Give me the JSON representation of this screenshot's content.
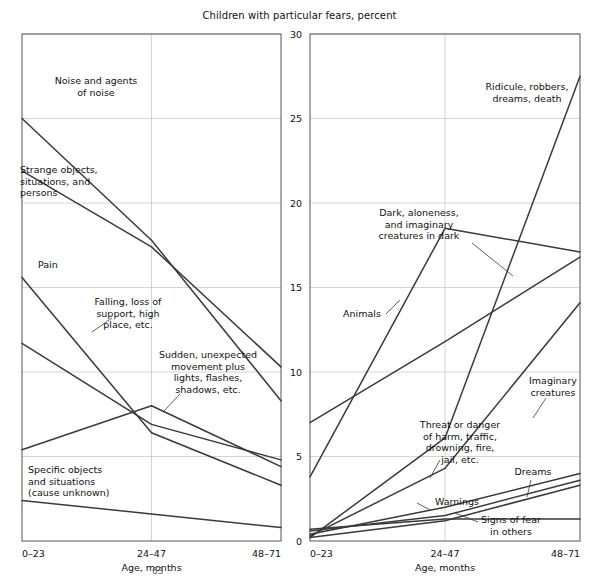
{
  "figure": {
    "title": "Children with particular fears, percent",
    "page_number": "63"
  },
  "chart_data": {
    "type": "line",
    "title": "Children with particular fears, percent",
    "xlabel": "Age, months",
    "ylabel": "",
    "categories": [
      "0–23",
      "24–47",
      "48–71"
    ],
    "ylim": [
      0,
      30
    ],
    "yticks": [
      0,
      5,
      10,
      15,
      20,
      25,
      30
    ],
    "grid": true,
    "legend": "annotations-on-lines",
    "panels": [
      {
        "name": "left-panel",
        "xlabel": "Age, months",
        "xticklabels": [
          "0–23",
          "24–47",
          "48–71"
        ],
        "series": [
          {
            "name": "Noise and agents of noise",
            "values": [
              25.0,
              17.8,
              8.3
            ]
          },
          {
            "name": "Strange objects, situations, and persons",
            "values": [
              21.9,
              17.4,
              10.3
            ]
          },
          {
            "name": "Pain",
            "values": [
              15.6,
              6.4,
              3.3
            ]
          },
          {
            "name": "Falling, loss of support, high place, etc.",
            "values": [
              11.7,
              6.9,
              4.8
            ]
          },
          {
            "name": "Sudden, unexpected movement plus lights, flashes, shadows, etc.",
            "values": [
              5.4,
              8.0,
              4.4
            ]
          },
          {
            "name": "Specific objects and situations (cause unknown)",
            "values": [
              2.4,
              1.6,
              0.8
            ]
          }
        ]
      },
      {
        "name": "right-panel",
        "xlabel": "Age, months",
        "xticklabels": [
          "0–23",
          "24–47",
          "48–71"
        ],
        "series": [
          {
            "name": "Ridicule, robbers, dreams, death",
            "values": [
              0.2,
              6.1,
              27.5
            ]
          },
          {
            "name": "Dark, aloneness, and imaginary creatures in dark",
            "values": [
              3.8,
              18.5,
              17.1
            ]
          },
          {
            "name": "Animals",
            "values": [
              7.0,
              11.8,
              16.8
            ]
          },
          {
            "name": "Imaginary creatures",
            "values": [
              0.3,
              4.3,
              14.1
            ]
          },
          {
            "name": "Threat or danger of harm, traffic, drowning, fire, jail, etc.",
            "values": [
              0.4,
              2.0,
              4.0
            ]
          },
          {
            "name": "Warnings",
            "values": [
              0.6,
              1.5,
              3.6
            ]
          },
          {
            "name": "Dreams",
            "values": [
              0.2,
              1.2,
              3.3
            ]
          },
          {
            "name": "Signs of fear in others",
            "values": [
              0.7,
              1.3,
              1.3
            ]
          }
        ]
      }
    ]
  },
  "left_panel": {
    "x_axis_title": "Age, months",
    "xticks": [
      "0–23",
      "24–47",
      "48–71"
    ],
    "annotations": [
      {
        "id": "noise",
        "lines": [
          "Noise and agents",
          "of noise"
        ]
      },
      {
        "id": "strange-objects",
        "lines": [
          "Strange objects,",
          "situations, and",
          "persons"
        ]
      },
      {
        "id": "pain",
        "lines": [
          "Pain"
        ]
      },
      {
        "id": "falling",
        "lines": [
          "Falling, loss of",
          "support, high",
          "place, etc."
        ]
      },
      {
        "id": "sudden-movement",
        "lines": [
          "Sudden, unexpected",
          "movement plus",
          "lights, flashes,",
          "shadows, etc."
        ]
      },
      {
        "id": "specific-objects",
        "lines": [
          "Specific objects",
          "and situations",
          "(cause unknown)"
        ]
      }
    ]
  },
  "right_panel": {
    "x_axis_title": "Age, months",
    "xticks": [
      "0–23",
      "24–47",
      "48–71"
    ],
    "yticks": [
      "0",
      "5",
      "10",
      "15",
      "20",
      "25",
      "30"
    ],
    "annotations": [
      {
        "id": "ridicule",
        "lines": [
          "Ridicule, robbers,",
          "dreams, death"
        ]
      },
      {
        "id": "dark-aloneness",
        "lines": [
          "Dark, aloneness,",
          "and imaginary",
          "creatures in dark"
        ]
      },
      {
        "id": "animals",
        "lines": [
          "Animals"
        ]
      },
      {
        "id": "imaginary-creatures",
        "lines": [
          "Imaginary",
          "creatures"
        ]
      },
      {
        "id": "threat-danger",
        "lines": [
          "Threat or danger",
          "of harm, traffic,",
          "drowning, fire,",
          "jail, etc."
        ]
      },
      {
        "id": "warnings",
        "lines": [
          "Warnings"
        ]
      },
      {
        "id": "dreams",
        "lines": [
          "Dreams"
        ]
      },
      {
        "id": "signs-of-fear",
        "lines": [
          "Signs of fear",
          "in others"
        ]
      }
    ]
  },
  "colors": {
    "line": "#3a3a3a",
    "axis": "#555555",
    "grid": "#c9c9c9",
    "text": "#111111",
    "background": "#ffffff"
  }
}
